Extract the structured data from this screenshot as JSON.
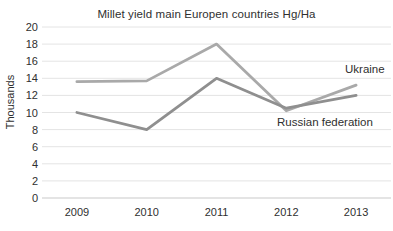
{
  "chart": {
    "title": "Millet yield main Europen countries Hg/Ha",
    "ylabel": "Thousands"
  },
  "chart_data": {
    "type": "line",
    "title": "Millet yield main Europen countries Hg/Ha",
    "ylabel": "Thousands",
    "xlabel": "",
    "categories": [
      "2009",
      "2010",
      "2011",
      "2012",
      "2013"
    ],
    "series": [
      {
        "name": "Ukraine",
        "values": [
          13.6,
          13.7,
          18,
          10.2,
          13.2
        ],
        "color": "#a9a9a9"
      },
      {
        "name": "Russian federation",
        "values": [
          10,
          8,
          14,
          10.5,
          12
        ],
        "color": "#8f8f8f"
      }
    ],
    "ylim": [
      0,
      20
    ],
    "ytick_step": 2,
    "grid": true,
    "grid_color": "#e4e4e4",
    "axis_line_color": "#c9c9c9",
    "legend_position": "inline-end-labels",
    "text_color": "#2f2f2f"
  }
}
